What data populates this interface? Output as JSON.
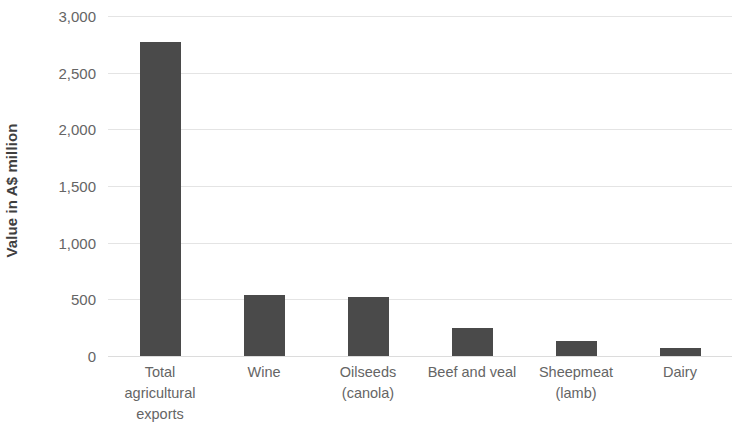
{
  "chart_data": {
    "type": "bar",
    "title": "",
    "xlabel": "",
    "ylabel": "Value in A$ million",
    "categories": [
      "Total agricultural exports",
      "Wine",
      "Oilseeds (canola)",
      "Beef and veal",
      "Sheepmeat (lamb)",
      "Dairy"
    ],
    "category_lines": [
      [
        "Total",
        "agricultural",
        "exports"
      ],
      [
        "Wine"
      ],
      [
        "Oilseeds",
        "(canola)"
      ],
      [
        "Beef and veal"
      ],
      [
        "Sheepmeat",
        "(lamb)"
      ],
      [
        "Dairy"
      ]
    ],
    "values": [
      2770,
      540,
      520,
      250,
      135,
      70
    ],
    "ylim": [
      0,
      3000
    ],
    "ytick_values": [
      0,
      500,
      1000,
      1500,
      2000,
      2500,
      3000
    ],
    "ytick_labels": [
      "0",
      "500",
      "1,000",
      "1,500",
      "2,000",
      "2,500",
      "3,000"
    ],
    "grid": true,
    "grid_axis": "y",
    "legend": false,
    "bar_color": "#4a4a4a",
    "grid_color": "#e4e4e4",
    "text_color": "#656565",
    "axis_title_color": "#3f3f3f",
    "background_color": "#ffffff"
  }
}
